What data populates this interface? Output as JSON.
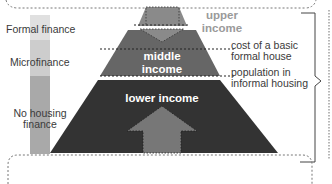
{
  "diagram": {
    "colors": {
      "upper_income": "#8a8a8a",
      "middle_income": "#666666",
      "lower_income": "#333333",
      "arrow_fill": "#777777",
      "formal_finance_bar": "#e0e0e0",
      "microfinance_bar": "#cdcdcd",
      "no_housing_finance_bar": "#a9a9a9",
      "line": "#333333",
      "dotted": "#888888"
    },
    "finance_bar": {
      "segments": [
        {
          "label": "Formal finance"
        },
        {
          "label": "Microfinance"
        },
        {
          "label": "No housing finance",
          "lines": [
            "No housing",
            "finance"
          ]
        }
      ]
    },
    "pyramid": {
      "tiers": [
        {
          "label": "upper income",
          "lines": [
            "upper",
            "income"
          ]
        },
        {
          "label": "middle income",
          "lines": [
            "middle",
            "income"
          ]
        },
        {
          "label": "lower income",
          "lines": [
            "lower income"
          ]
        }
      ]
    },
    "thresholds": [
      {
        "label": "cost of a basic formal house",
        "lines": [
          "cost of a basic",
          "formal house"
        ]
      },
      {
        "label": "population in informal housing",
        "lines": [
          "population in",
          "informal housing"
        ]
      }
    ]
  }
}
